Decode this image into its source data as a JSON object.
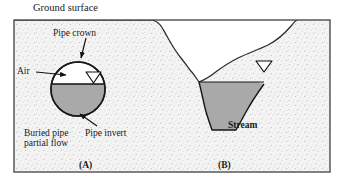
{
  "figure": {
    "labels": {
      "ground_surface": "Ground surface",
      "pipe_crown": "Pipe crown",
      "air": "Air",
      "buried_pipe_line1": "Buried pipe",
      "buried_pipe_line2": "partial flow",
      "pipe_invert": "Pipe invert",
      "stream": "Stream",
      "panel_a": "(A)",
      "panel_b": "(B)"
    },
    "colors": {
      "water": "#a9a9a9",
      "soil": "#f2f2f2",
      "outline": "#1a1a1a",
      "frame": "#4d4d4d",
      "background": "#ffffff"
    },
    "elements": {
      "pipe": "buried-circular-pipe-partial-flow",
      "pipe_water_fill_fraction": "0.62",
      "stream_channel": "trapezoidal-open-channel",
      "water_surface_symbol": "inverted-open-triangle"
    }
  }
}
